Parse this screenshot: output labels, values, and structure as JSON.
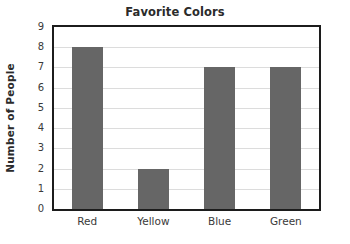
{
  "chart_data": {
    "type": "bar",
    "title": "Favorite Colors",
    "xlabel": "",
    "ylabel": "Number of People",
    "categories": [
      "Red",
      "Yellow",
      "Blue",
      "Green"
    ],
    "values": [
      8,
      2,
      7,
      7
    ],
    "ylim": [
      0,
      9
    ],
    "ytick_labels": [
      "0",
      "1",
      "2",
      "3",
      "4",
      "5",
      "6",
      "7",
      "8",
      "9"
    ],
    "ytick_values": [
      0,
      1,
      2,
      3,
      4,
      5,
      6,
      7,
      8,
      9
    ],
    "grid": "horizontal",
    "legend": "none",
    "bar_color": "#666666",
    "grid_color": "#dcdcdc",
    "axis_color": "#1c1c1c",
    "background_color": "#ffffff",
    "text_color": "#3a3a3a"
  }
}
